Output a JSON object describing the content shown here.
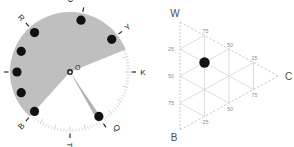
{
  "figure": {
    "background_color": "#ffffff",
    "panels": [
      {
        "id": "rose-diagram",
        "type": "polar-rose"
      },
      {
        "id": "ternary-diagram",
        "type": "ternary"
      }
    ]
  },
  "rose": {
    "center_label": "O",
    "center": {
      "x": 70,
      "y": 72
    },
    "radius": 60,
    "marker_radius": 53,
    "wedge_color": "#bfbfbf",
    "needle_color": "#b3b3b3",
    "marker_color": "#111111",
    "tick_color": "#c9c9c9",
    "wedge": {
      "start_deg": 22,
      "end_deg": 228,
      "label": "gray-sector"
    },
    "needle": {
      "angle_deg": 302,
      "width_deg": 5,
      "label": "needle-ray"
    },
    "points": [
      {
        "label": "O",
        "angle_deg": 78,
        "label_angle_deg": 90,
        "has_marker": true,
        "has_tick": true
      },
      {
        "label": "Y",
        "angle_deg": 38,
        "label_angle_deg": 38,
        "has_marker": true,
        "has_tick": true
      },
      {
        "label": "K",
        "angle_deg": 0,
        "label_angle_deg": 0,
        "has_marker": false,
        "has_tick": true
      },
      {
        "label": "Q",
        "angle_deg": -57,
        "label_angle_deg": -50,
        "has_marker": true,
        "has_tick": true
      },
      {
        "label": "T",
        "angle_deg": -90,
        "label_angle_deg": -90,
        "has_marker": false,
        "has_tick": true
      },
      {
        "label": "B",
        "angle_deg": -132,
        "label_angle_deg": -132,
        "has_marker": true,
        "has_tick": true
      },
      {
        "label": "P",
        "angle_deg": 180,
        "label_angle_deg": 180,
        "has_marker": true,
        "has_tick": true
      },
      {
        "label": "R",
        "angle_deg": 132,
        "label_angle_deg": 132,
        "has_marker": true,
        "has_tick": true
      }
    ],
    "extra_markers": [
      {
        "angle_deg": 157
      },
      {
        "angle_deg": 203
      }
    ]
  },
  "ternary": {
    "vertices": [
      {
        "label": "W",
        "position": "top-left"
      },
      {
        "label": "C",
        "position": "right"
      },
      {
        "label": "B",
        "position": "bottom-left"
      }
    ],
    "axis_color": "#c2c2c2",
    "grid_color": "#d4d4d4",
    "dotted_axis_color": "#bdbdbd",
    "point_color": "#141414",
    "ticks_left": [
      "25",
      "50",
      "75"
    ],
    "ticks_top": [
      "75",
      "50",
      "25"
    ],
    "ticks_bottom": [
      "25",
      "50",
      "75"
    ],
    "data_point": {
      "W": 50,
      "C": 25,
      "B": 25,
      "label": "sample-point"
    }
  },
  "chart_data": {
    "type": "scatter",
    "title": "",
    "charts": [
      {
        "type": "pie",
        "name": "rose-diagram",
        "title": "",
        "categories": [
          "O",
          "Y",
          "K",
          "Q",
          "T",
          "B",
          "P",
          "R"
        ],
        "values": [
          78,
          38,
          0,
          -57,
          -90,
          -132,
          180,
          132
        ],
        "xlabel": "azimuth (degrees)",
        "ylabel": "",
        "annotations": [
          "O",
          "Y",
          "K",
          "Q",
          "T",
          "B",
          "P",
          "R"
        ],
        "sector_start_deg": 22,
        "sector_end_deg": 228,
        "needle_deg": 302,
        "grid": false,
        "legend": "none"
      },
      {
        "type": "scatter",
        "name": "ternary-diagram",
        "title": "",
        "axes": [
          "W",
          "C",
          "B"
        ],
        "tick_values": [
          25,
          50,
          75
        ],
        "points": [
          {
            "W": 50,
            "C": 25,
            "B": 25
          }
        ],
        "xlabel": "",
        "ylabel": "",
        "grid": true,
        "legend": "none"
      }
    ]
  }
}
